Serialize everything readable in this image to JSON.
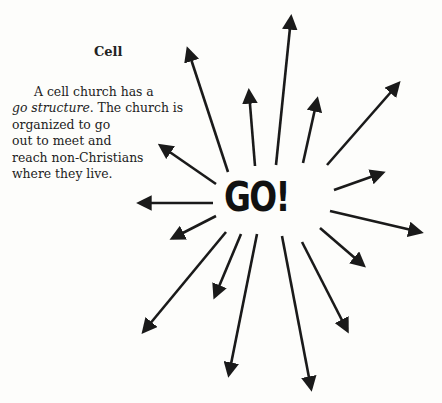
{
  "heading": "Cell",
  "paragraph": {
    "line1": "A cell church has a",
    "line2_italic": "go structure",
    "line2_rest": ". The church is",
    "line3": "organized  to  go",
    "line4": "out  to  meet  and",
    "line5": "reach non-Christians",
    "line6": "where they live."
  },
  "center_label": "GO!",
  "arrows": [
    {
      "from": [
        228,
        172
      ],
      "to": [
        188,
        50
      ]
    },
    {
      "from": [
        255,
        166
      ],
      "to": [
        249,
        92
      ]
    },
    {
      "from": [
        276,
        165
      ],
      "to": [
        291,
        18
      ]
    },
    {
      "from": [
        303,
        163
      ],
      "to": [
        317,
        100
      ]
    },
    {
      "from": [
        327,
        165
      ],
      "to": [
        398,
        84
      ]
    },
    {
      "from": [
        334,
        190
      ],
      "to": [
        382,
        173
      ]
    },
    {
      "from": [
        330,
        211
      ],
      "to": [
        420,
        232
      ]
    },
    {
      "from": [
        320,
        228
      ],
      "to": [
        363,
        265
      ]
    },
    {
      "from": [
        302,
        242
      ],
      "to": [
        347,
        330
      ]
    },
    {
      "from": [
        282,
        236
      ],
      "to": [
        311,
        388
      ]
    },
    {
      "from": [
        257,
        234
      ],
      "to": [
        229,
        374
      ]
    },
    {
      "from": [
        241,
        234
      ],
      "to": [
        215,
        296
      ]
    },
    {
      "from": [
        226,
        232
      ],
      "to": [
        144,
        331
      ]
    },
    {
      "from": [
        216,
        216
      ],
      "to": [
        173,
        238
      ]
    },
    {
      "from": [
        213,
        203
      ],
      "to": [
        140,
        203
      ]
    },
    {
      "from": [
        216,
        184
      ],
      "to": [
        161,
        146
      ]
    }
  ],
  "colors": {
    "ink": "#1a1a1a",
    "paper": "#fdfdfb"
  }
}
